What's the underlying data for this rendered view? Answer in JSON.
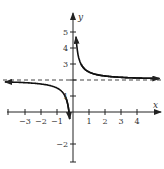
{
  "chart_data": {
    "type": "line",
    "title": "",
    "function": "y = 2 + 1/(2x)",
    "xlabel": "x",
    "ylabel": "y",
    "xlim": [
      -4,
      5
    ],
    "ylim": [
      -3,
      6
    ],
    "x_ticks": [
      -3,
      -2,
      -1,
      1,
      2,
      3,
      4
    ],
    "x_tick_labels": [
      "−3",
      "−2",
      "−1",
      "1",
      "2",
      "3",
      "4"
    ],
    "y_ticks": [
      -2,
      1,
      2,
      3,
      4,
      5
    ],
    "y_tick_labels": [
      "−2",
      "1",
      "3",
      "4",
      "5"
    ],
    "asymptotes": {
      "horizontal": 2,
      "vertical": 0,
      "horizontal_style": "dashed"
    },
    "grid": false,
    "series": [
      {
        "name": "right-branch",
        "x": [
          0.18,
          0.25,
          0.5,
          1,
          2,
          3,
          4,
          5.4
        ],
        "y": [
          4.8,
          4.0,
          3.0,
          2.5,
          2.25,
          2.17,
          2.125,
          2.09
        ]
      },
      {
        "name": "left-branch",
        "x": [
          -4.3,
          -3,
          -2,
          -1,
          -0.5,
          -0.3,
          -0.2
        ],
        "y": [
          1.88,
          1.83,
          1.75,
          1.5,
          1.0,
          0.33,
          -0.5
        ]
      }
    ]
  },
  "labels": {
    "x": "x",
    "y": "y"
  }
}
